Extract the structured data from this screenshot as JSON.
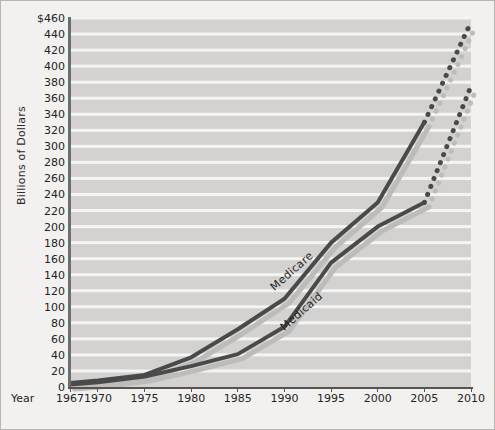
{
  "chart_data": {
    "type": "line",
    "title": "",
    "xlabel": "Year",
    "ylabel": "Billions of Dollars",
    "xlim": [
      1967,
      2010
    ],
    "ylim": [
      0,
      460
    ],
    "grid": true,
    "grid_orientation": "horizontal",
    "legend_position": "inline-annotation",
    "x_tick_labels": [
      "1967",
      "1970",
      "1975",
      "1980",
      "1985",
      "1990",
      "1995",
      "2000",
      "2005",
      "2010"
    ],
    "x_tick_values": [
      1967,
      1970,
      1975,
      1980,
      1985,
      1990,
      1995,
      2000,
      2005,
      2010
    ],
    "y_tick_labels": [
      "0",
      "20",
      "40",
      "60",
      "80",
      "100",
      "120",
      "140",
      "160",
      "180",
      "200",
      "220",
      "240",
      "260",
      "280",
      "300",
      "320",
      "340",
      "360",
      "380",
      "400",
      "420",
      "440",
      "$460"
    ],
    "y_tick_values": [
      0,
      20,
      40,
      60,
      80,
      100,
      120,
      140,
      160,
      180,
      200,
      220,
      240,
      260,
      280,
      300,
      320,
      340,
      360,
      380,
      400,
      420,
      440,
      460
    ],
    "series": [
      {
        "name": "Medicare",
        "color": "#4a4a4a",
        "actual": {
          "x": [
            1967,
            1970,
            1975,
            1980,
            1985,
            1990,
            1995,
            2000,
            2005
          ],
          "values": [
            5,
            8,
            15,
            37,
            72,
            110,
            180,
            230,
            330
          ]
        },
        "projected": {
          "style": "dotted",
          "x": [
            2005,
            2010
          ],
          "values": [
            330,
            455
          ]
        }
      },
      {
        "name": "Medicaid",
        "color": "#4a4a4a",
        "actual": {
          "x": [
            1967,
            1970,
            1975,
            1980,
            1985,
            1990,
            1995,
            2000,
            2005
          ],
          "values": [
            3,
            6,
            13,
            26,
            41,
            75,
            155,
            200,
            230
          ]
        },
        "projected": {
          "style": "dotted",
          "x": [
            2005,
            2010
          ],
          "values": [
            230,
            375
          ]
        }
      }
    ]
  },
  "annotations": {
    "medicare_label": "Medicare",
    "medicaid_label": "Medicaid"
  },
  "colors": {
    "panel_background": "#d3d2d0",
    "figure_background": "#f2f1ef",
    "gridline": "#f4f4f3",
    "line": "#4a4a4a",
    "shadow": "#bdbcba",
    "axis": "#565452",
    "text": "#242424"
  }
}
